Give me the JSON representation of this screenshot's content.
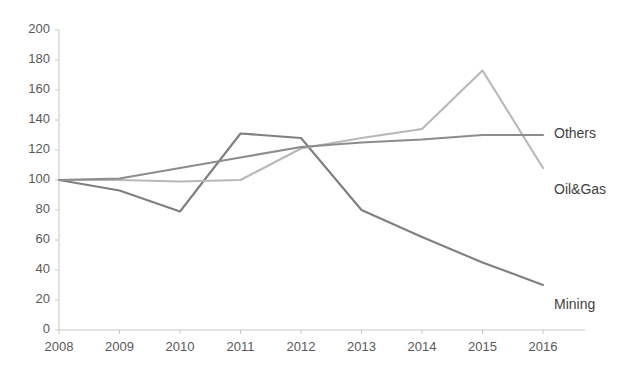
{
  "chart_data": {
    "type": "line",
    "title": "",
    "subtitle": "",
    "xlabel": "",
    "ylabel": "",
    "categories": [
      "2008",
      "2009",
      "2010",
      "2011",
      "2012",
      "2013",
      "2014",
      "2015",
      "2016"
    ],
    "x": [
      2008,
      2009,
      2010,
      2011,
      2012,
      2013,
      2014,
      2015,
      2016
    ],
    "ylim": [
      0,
      200
    ],
    "yticks": [
      0,
      20,
      40,
      60,
      80,
      100,
      120,
      140,
      160,
      180,
      200
    ],
    "ytick_labels": [
      "0",
      "20",
      "40",
      "60",
      "80",
      "100",
      "120",
      "140",
      "160",
      "180",
      "200"
    ],
    "grid": false,
    "legend_position": "inline-right-end-labels",
    "series": [
      {
        "name": "Mining",
        "color": "#7f7f7f",
        "values": [
          100,
          93,
          79,
          131,
          128,
          80,
          62,
          45,
          30
        ],
        "label_value": 30,
        "label_year": 2016
      },
      {
        "name": "Oil&Gas",
        "color": "#b8b8b8",
        "values": [
          100,
          100,
          99,
          100,
          121,
          128,
          134,
          173,
          108
        ],
        "label_value": 108,
        "label_year": 2016
      },
      {
        "name": "Others",
        "color": "#8c8c8c",
        "values": [
          100,
          101,
          108,
          115,
          122,
          125,
          127,
          130,
          130
        ],
        "label_value": 130,
        "label_year": 2016
      }
    ]
  },
  "axes": {
    "y_axis_name": "y-axis",
    "x_axis_name": "x-axis"
  },
  "labels": {
    "others": "Others",
    "oil_and_gas": "Oil&Gas",
    "mining": "Mining"
  }
}
